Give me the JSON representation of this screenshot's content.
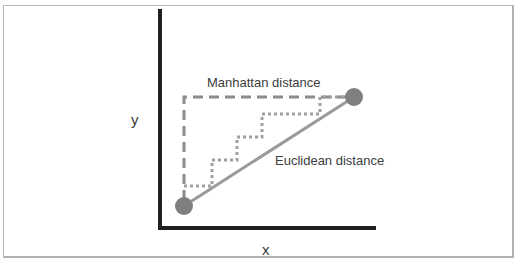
{
  "diagram": {
    "axis_labels": {
      "x": "x",
      "y": "y"
    },
    "annotations": {
      "manhattan": "Manhattan distance",
      "euclidean": "Euclidean distance"
    },
    "points": [
      {
        "name": "start",
        "cx": 184,
        "cy": 206
      },
      {
        "name": "end",
        "cx": 354,
        "cy": 97
      }
    ],
    "colors": {
      "axis": "#1f1f1f",
      "point": "#7f7f7f",
      "euclidean_line": "#9a9a9a",
      "manhattan_dashed": "#8c8c8c",
      "staircase_dotted": "#a0a0a0",
      "text": "#3c3c3c"
    }
  }
}
